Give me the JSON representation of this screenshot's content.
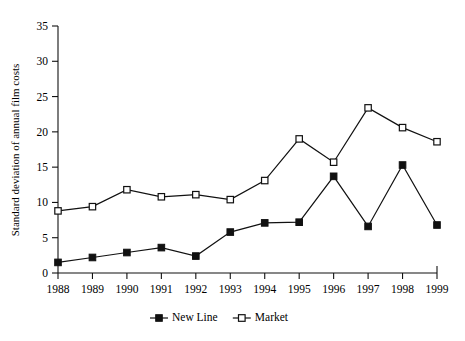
{
  "chart_data": {
    "type": "line",
    "title": "",
    "xlabel": "",
    "ylabel": "Standard deviation of annual film costs",
    "categories": [
      "1988",
      "1989",
      "1990",
      "1991",
      "1992",
      "1993",
      "1994",
      "1995",
      "1996",
      "1997",
      "1998",
      "1999"
    ],
    "x": [
      1988,
      1989,
      1990,
      1991,
      1992,
      1993,
      1994,
      1995,
      1996,
      1997,
      1998,
      1999
    ],
    "series": [
      {
        "name": "New Line",
        "marker": "filled-square",
        "values": [
          1.5,
          2.2,
          2.9,
          3.6,
          2.4,
          5.8,
          7.1,
          7.2,
          13.7,
          6.6,
          15.3,
          6.8
        ]
      },
      {
        "name": "Market",
        "marker": "open-square",
        "values": [
          8.8,
          9.4,
          11.8,
          10.8,
          11.1,
          10.4,
          13.1,
          19.0,
          15.7,
          23.4,
          20.6,
          18.6
        ]
      }
    ],
    "ylim": [
      0,
      35
    ],
    "yticks": [
      0,
      5,
      10,
      15,
      20,
      25,
      30,
      35
    ],
    "ytick_labels": [
      "0",
      "5",
      "10",
      "15",
      "20",
      "25",
      "30",
      "35"
    ],
    "grid": false,
    "legend_position": "bottom",
    "legend_entries": [
      "New Line",
      "Market"
    ],
    "colors": {
      "line": "#111111",
      "marker_fill": "#111111",
      "marker_open_fill": "#ffffff",
      "background": "#ffffff"
    }
  }
}
